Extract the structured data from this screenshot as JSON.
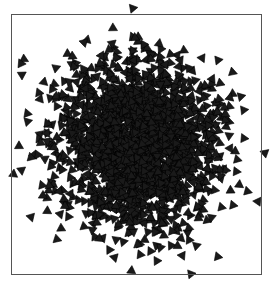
{
  "figure": {
    "width": 278,
    "height": 289,
    "background_color": "#ffffff",
    "title": "",
    "caption": ""
  },
  "frame": {
    "name": "plot-border",
    "left": 11,
    "top": 14,
    "width": 251,
    "height": 261,
    "border_color": "#555555",
    "border_width": 1,
    "fill": "none"
  },
  "chart_data": {
    "type": "scatter",
    "title": "",
    "subtitle": "",
    "xlabel": "",
    "ylabel": "",
    "xlim": [
      -3.2,
      3.2
    ],
    "ylim": [
      -3.2,
      3.2
    ],
    "grid": false,
    "legend": null,
    "xticks": [],
    "yticks": [],
    "xticklabels": [],
    "yticklabels": [],
    "axis_visible": false,
    "frame_visible": true,
    "marker": {
      "shape": "triangle",
      "symbol": "▶",
      "size_px": 5.2,
      "fill_color": "#1a1a1a",
      "edge_color": "#000000",
      "rotation_mode": "random",
      "alpha": 1.0
    },
    "point_count": 2000,
    "distribution": {
      "name": "bivariate-gaussian",
      "mean_x": 0.0,
      "mean_y": 0.0,
      "std_x": 1.0,
      "std_y": 1.0,
      "correlation": 0.0,
      "random_seed": 20240517
    },
    "series": [
      {
        "name": "points",
        "marker": "triangle",
        "color": "#1a1a1a",
        "n": 2000
      }
    ]
  }
}
